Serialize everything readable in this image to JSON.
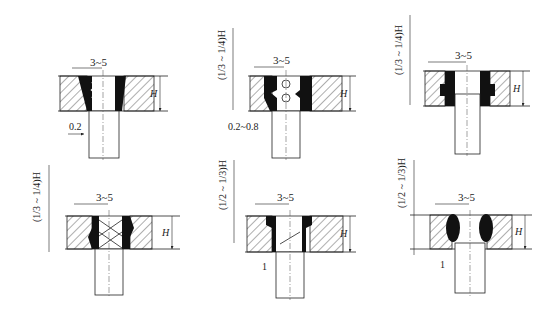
{
  "diagram": {
    "type": "engineering-drawing",
    "colors": {
      "ink": "#1a1a1a",
      "background": "#ffffff"
    },
    "panels": [
      {
        "id": "a",
        "gap_label": "3~5",
        "height_label": "H",
        "offset_label": "0.2",
        "fraction_label": ""
      },
      {
        "id": "b",
        "gap_label": "3~5",
        "height_label": "H",
        "offset_label": "0.2~0.8",
        "fraction_label": "(1/3 ~ 1/4)H"
      },
      {
        "id": "c",
        "gap_label": "3~5",
        "height_label": "H",
        "offset_label": "",
        "fraction_label": "(1/3 ~ 1/4)H"
      },
      {
        "id": "d",
        "gap_label": "3~5",
        "height_label": "H",
        "offset_label": "",
        "fraction_label": "(1/3 ~ 1/4)H"
      },
      {
        "id": "e",
        "gap_label": "3~5",
        "height_label": "H",
        "offset_label": "1",
        "fraction_label": "(1/2 ~ 1/3)H"
      },
      {
        "id": "f",
        "gap_label": "3~5",
        "height_label": "H",
        "offset_label": "1",
        "fraction_label": "(1/2 ~ 1/3)H"
      }
    ]
  }
}
